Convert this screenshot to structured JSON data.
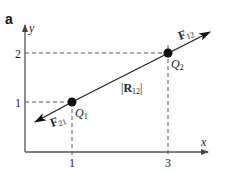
{
  "panel_label": "a",
  "axes": {
    "x_label": "x",
    "y_label": "y",
    "x_ticks": [
      "1",
      "3"
    ],
    "y_ticks": [
      "1",
      "2"
    ]
  },
  "points": [
    {
      "name": "Q",
      "sub": "1",
      "x": 1,
      "y": 1
    },
    {
      "name": "Q",
      "sub": "2",
      "x": 3,
      "y": 2
    }
  ],
  "vectors": {
    "f12": {
      "main": "F",
      "sub": "12"
    },
    "f21": {
      "main": "F",
      "sub": "21"
    },
    "r12": {
      "open": "|",
      "main": "R",
      "sub": "12",
      "close": "|"
    }
  },
  "colors": {
    "line": "#222222",
    "dash": "#555555",
    "axis": "#555555"
  }
}
